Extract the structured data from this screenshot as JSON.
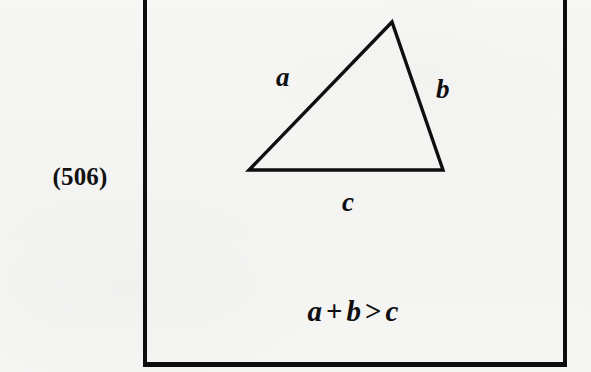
{
  "figure": {
    "number_label": "(506)",
    "caption_equation": "a + b > c",
    "equation_parts": {
      "term_1": "a",
      "operator_1": "+",
      "term_2": "b",
      "operator_2": ">",
      "term_3": "c"
    },
    "background_color": "#f4f4f4",
    "ink_color": "#0f0f0f",
    "box": {
      "border_color": "#0d0d0d",
      "border_width_px": 4,
      "left_px": 143,
      "right_px": 559,
      "bottom_px": 362,
      "top_edge_state": "cropped"
    },
    "shape": {
      "type": "triangle",
      "stroke_color": "#0f0f0f",
      "stroke_width_px": 3,
      "fill": "none",
      "vertices": [
        {
          "name": "apex",
          "x": 249,
          "y": 22
        },
        {
          "name": "bottom-left",
          "x": 106,
          "y": 170
        },
        {
          "name": "bottom-right",
          "x": 300,
          "y": 170
        }
      ],
      "side_labels": [
        {
          "id": "a",
          "text": "a",
          "side": "left-slant",
          "x": 276,
          "y": 64
        },
        {
          "id": "b",
          "text": "b",
          "side": "right-slant",
          "x": 436,
          "y": 76
        },
        {
          "id": "c",
          "text": "c",
          "side": "base",
          "x": 342,
          "y": 189
        }
      ]
    }
  }
}
